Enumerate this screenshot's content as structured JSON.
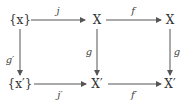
{
  "diagram": {
    "type": "commutative-square",
    "nodes": {
      "top_left": "{x}",
      "top_mid": "X",
      "top_right": "X",
      "bottom_left": "{x′}",
      "bottom_mid": "X′",
      "bottom_right": "X′"
    },
    "arrows": {
      "j": "j",
      "f": "f",
      "g_prime": "g′",
      "g_mid": "g",
      "g_right": "g",
      "j_prime": "j′",
      "f_prime": "f′"
    },
    "colors": {
      "stroke": "#555555",
      "text": "#333333"
    }
  }
}
